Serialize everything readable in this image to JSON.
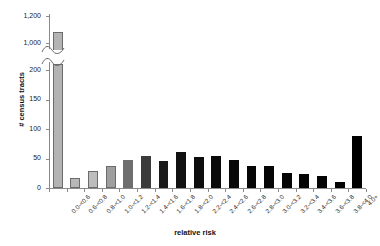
{
  "chart": {
    "type": "bar",
    "title": "",
    "xlabel": "relative risk",
    "ylabel": "# census tracts"
  },
  "chart_data": {
    "type": "bar",
    "title": "",
    "xlabel": "relative risk",
    "ylabel": "# census tracts",
    "axis_break": true,
    "lower_panel_ylim": [
      0,
      200
    ],
    "upper_panel_ylim": [
      1000,
      1200
    ],
    "grid": false,
    "legend": "none",
    "ytick_labels_lower": [
      "0",
      "50",
      "100",
      "150",
      "200"
    ],
    "ytick_values_lower": [
      0,
      50,
      100,
      150,
      200
    ],
    "ytick_labels_upper": [
      "1,000",
      "1,200"
    ],
    "ytick_values_upper": [
      1000,
      1200
    ],
    "categories": [
      "0.0-<0.6",
      "0.6-<0.8",
      "0.8-<1.0",
      "1.0-<1.2",
      "1.2-<1.4",
      "1.4-<1.6",
      "1.6-<1.8",
      "1.8-<2.0",
      "2.2-<2.4",
      "2.4-<2.6",
      "2.6-<2.8",
      "2.8-<3.0",
      "3.0-<3.2",
      "3.2-<3.4",
      "3.4-<3.6",
      "3.6-<3.8",
      "3.8-<4.0",
      "4.0+"
    ],
    "values": [
      1080,
      17,
      29,
      37,
      47,
      55,
      45,
      61,
      52,
      55,
      47,
      38,
      38,
      26,
      24,
      20,
      11,
      88
    ],
    "bar_colors": [
      "#b3b3b3",
      "#b8b8b8",
      "#bdbdbd",
      "#9e9e9e",
      "#6e6e6e",
      "#3b3b3b",
      "#1a1a1a",
      "#111111",
      "#0d0d0d",
      "#0a0a0a",
      "#080808",
      "#060606",
      "#050505",
      "#050505",
      "#040404",
      "#040404",
      "#030303",
      "#000000"
    ]
  }
}
